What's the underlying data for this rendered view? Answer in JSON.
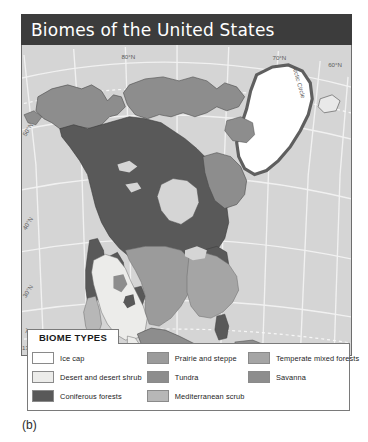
{
  "figure": {
    "title": "Biomes of the United States",
    "caption": "(b)"
  },
  "legend": {
    "title": "BIOME TYPES",
    "columns": [
      {
        "items": [
          {
            "label": "Ice cap",
            "color": "#ffffff"
          },
          {
            "label": "Desert and desert shrub",
            "color": "#ececea"
          },
          {
            "label": "Coniferous forests",
            "color": "#595959"
          }
        ]
      },
      {
        "items": [
          {
            "label": "Prairie and steppe",
            "color": "#9b9b9b"
          },
          {
            "label": "Tundra",
            "color": "#8d8d8d"
          },
          {
            "label": "Mediterranean scrub",
            "color": "#b7b7b7"
          }
        ]
      },
      {
        "items": [
          {
            "label": "Temperate mixed forests",
            "color": "#a5a5a5"
          },
          {
            "label": "Savanna",
            "color": "#8d8d8d"
          }
        ]
      }
    ]
  },
  "map": {
    "ocean_color": "#d5d5d5",
    "graticule_color": "#f2f2f2",
    "border_color": "#6d6d6d",
    "labels": {
      "lon_130w": "130°W",
      "lon_90w": "90°W",
      "lon_70w": "70°W",
      "lat_80n": "80°N",
      "lat_70n": "70°N",
      "lat_60n": "60°N",
      "lat_50n": "50°N",
      "lat_40n": "40°N",
      "lat_30n": "30°N",
      "arctic_circle": "Arctic Circle",
      "tropic_of_cancer": "Tropic of Cancer"
    }
  }
}
